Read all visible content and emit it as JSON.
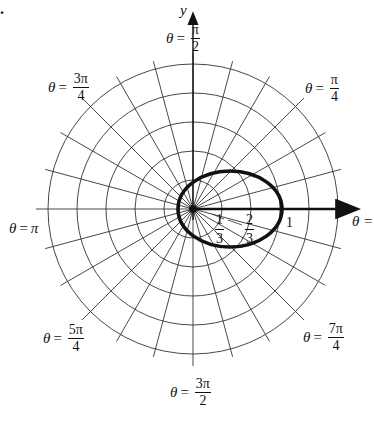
{
  "figure": {
    "corner_mark": ".",
    "y_axis_label": "y",
    "x_axis_label_fragment": "θ =",
    "theta_symbol": "θ",
    "equals": "=",
    "angle_labels": [
      {
        "id": "pi_over_2",
        "num": "π",
        "den": "2"
      },
      {
        "id": "pi_over_4",
        "num": "π",
        "den": "4"
      },
      {
        "id": "3pi_over_4",
        "num": "3π",
        "den": "4"
      },
      {
        "id": "pi",
        "text": "π"
      },
      {
        "id": "5pi_over_4",
        "num": "5π",
        "den": "4"
      },
      {
        "id": "7pi_over_4",
        "num": "7π",
        "den": "4"
      },
      {
        "id": "3pi_over_2",
        "num": "3π",
        "den": "2"
      }
    ],
    "radial_labels": [
      {
        "id": "one_third",
        "num": "1",
        "den": "3"
      },
      {
        "id": "two_thirds",
        "num": "2",
        "den": "3"
      },
      {
        "id": "one",
        "text": "1"
      }
    ]
  },
  "chart_data": {
    "type": "polar-grid",
    "title": "",
    "grid": {
      "rings": 5,
      "ring_values": [
        "1/3",
        "2/3",
        "1",
        "4/3",
        "5/3"
      ],
      "radial_lines_degrees_step": 15,
      "labeled_angles": [
        "π/2",
        "π/4",
        "3π/4",
        "π",
        "5π/4",
        "7π/4",
        "3π/2"
      ]
    },
    "axes": {
      "x_arrow": true,
      "y_arrow": true,
      "y_label": "y",
      "x_label": "θ = 0"
    },
    "curve": {
      "description": "closed egg-shaped polar curve through origin region",
      "r_at_theta_0": 1,
      "approx_points": [
        {
          "theta": "0",
          "r": 1
        },
        {
          "theta": "π/2",
          "r": 0.45
        },
        {
          "theta": "π",
          "r": 0.17
        },
        {
          "theta": "3π/2",
          "r": 0.45
        }
      ]
    },
    "radial_tick_labels": [
      "1/3",
      "2/3",
      "1"
    ]
  }
}
